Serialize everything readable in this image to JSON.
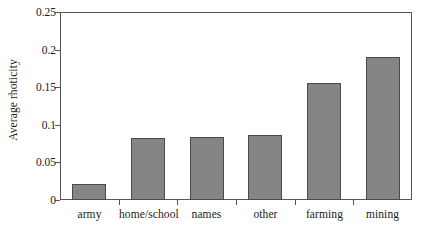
{
  "chart_data": {
    "type": "bar",
    "title": "",
    "xlabel": "",
    "ylabel": "Average rhoticity",
    "categories": [
      "army",
      "home/school",
      "names",
      "other",
      "farming",
      "mining"
    ],
    "values": [
      0.021,
      0.082,
      0.084,
      0.086,
      0.156,
      0.19
    ],
    "ylim": [
      0,
      0.25
    ],
    "yticks": [
      0,
      0.05,
      0.1,
      0.15,
      0.2,
      0.25
    ],
    "ytick_labels": [
      "0",
      "0.05",
      "0.1",
      "0.15",
      "0.2",
      "0.25"
    ],
    "grid": false,
    "legend": false,
    "bar_color": "#858585",
    "bar_border_color": "#4a4a4a",
    "axis_color": "#565656"
  }
}
